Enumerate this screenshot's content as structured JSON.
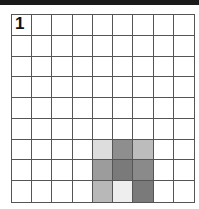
{
  "puzzle": {
    "number": "1",
    "rows": 9,
    "cols": 9,
    "shaded_cells": [
      {
        "row": 7,
        "col": 5,
        "color": "#dddddd"
      },
      {
        "row": 7,
        "col": 6,
        "color": "#8e8e8e"
      },
      {
        "row": 7,
        "col": 7,
        "color": "#bcbcbc"
      },
      {
        "row": 8,
        "col": 5,
        "color": "#9c9c9c"
      },
      {
        "row": 8,
        "col": 6,
        "color": "#7a7a7a"
      },
      {
        "row": 8,
        "col": 7,
        "color": "#8a8a8a"
      },
      {
        "row": 9,
        "col": 5,
        "color": "#b8b8b8"
      },
      {
        "row": 9,
        "col": 6,
        "color": "#eeeeee"
      },
      {
        "row": 9,
        "col": 7,
        "color": "#7a7a7a"
      }
    ]
  },
  "colors": {
    "topbar": "#1a1a1a",
    "gridline": "#555555"
  }
}
